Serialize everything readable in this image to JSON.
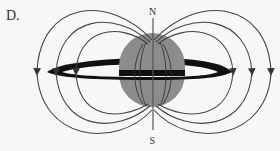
{
  "figure": {
    "option_label": "D.",
    "north_label": "N",
    "south_label": "S",
    "colors": {
      "background": "#f7f7f5",
      "sphere": "#8c8c8c",
      "ring": "#111111",
      "field_line": "#444444",
      "axis": "#555555"
    },
    "field_lines": {
      "left_arrow_x": [
        36,
        56,
        75
      ],
      "right_arrow_x": [
        233,
        252,
        271
      ],
      "arrow_y": 72,
      "arrow_direction": "down"
    }
  }
}
